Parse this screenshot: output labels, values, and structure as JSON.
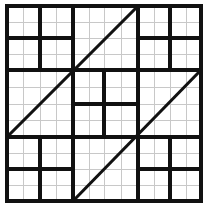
{
  "figure": {
    "type": "geometric-line-figure",
    "canvas": {
      "width": 208,
      "height": 213
    },
    "background_color": "#ffffff",
    "fine_grid_color": "#c8c8c8",
    "thick_line_color": "#111111"
  },
  "chart_data": {
    "type": "diagram",
    "xlabel": "",
    "ylabel": "",
    "xlim": [
      7,
      201
    ],
    "ylim": [
      6,
      201
    ],
    "grid": true,
    "legend": "none",
    "outer_square": {
      "left": 7,
      "top": 6,
      "right": 201,
      "bottom": 201
    },
    "thick_vertical_x": [
      7,
      40,
      73,
      104,
      138,
      170,
      201
    ],
    "thick_horizontal_y": [
      6,
      38,
      70,
      104,
      137,
      169,
      201
    ],
    "fine_grid_step": 16.25,
    "fine_vertical_x": [
      23,
      56,
      89,
      121,
      154,
      186
    ],
    "fine_horizontal_y": [
      22,
      54,
      87,
      120,
      153,
      185
    ],
    "segments": [
      {
        "name": "outer-top",
        "x1": 7,
        "y1": 6,
        "x2": 201,
        "y2": 6
      },
      {
        "name": "outer-bottom",
        "x1": 7,
        "y1": 201,
        "x2": 201,
        "y2": 201
      },
      {
        "name": "outer-left",
        "x1": 7,
        "y1": 6,
        "x2": 7,
        "y2": 201
      },
      {
        "name": "outer-right",
        "x1": 201,
        "y1": 6,
        "x2": 201,
        "y2": 201
      },
      {
        "name": "ring-top",
        "x1": 7,
        "y1": 70,
        "x2": 201,
        "y2": 70
      },
      {
        "name": "ring-bottom",
        "x1": 7,
        "y1": 137,
        "x2": 201,
        "y2": 137
      },
      {
        "name": "ring-left",
        "x1": 73,
        "y1": 6,
        "x2": 73,
        "y2": 201
      },
      {
        "name": "ring-right",
        "x1": 138,
        "y1": 6,
        "x2": 138,
        "y2": 201
      },
      {
        "name": "band-top",
        "x1": 7,
        "y1": 38,
        "x2": 73,
        "y2": 38
      },
      {
        "name": "band-top-right",
        "x1": 138,
        "y1": 38,
        "x2": 201,
        "y2": 38
      },
      {
        "name": "band-bottom",
        "x1": 7,
        "y1": 169,
        "x2": 73,
        "y2": 169
      },
      {
        "name": "band-bottom-right",
        "x1": 138,
        "y1": 169,
        "x2": 201,
        "y2": 169
      },
      {
        "name": "band-left-upper",
        "x1": 40,
        "y1": 6,
        "x2": 40,
        "y2": 70
      },
      {
        "name": "band-left-lower",
        "x1": 40,
        "y1": 137,
        "x2": 40,
        "y2": 201
      },
      {
        "name": "band-right-upper",
        "x1": 170,
        "y1": 6,
        "x2": 170,
        "y2": 70
      },
      {
        "name": "band-right-lower",
        "x1": 170,
        "y1": 137,
        "x2": 170,
        "y2": 201
      },
      {
        "name": "center-vertical",
        "x1": 104,
        "y1": 70,
        "x2": 104,
        "y2": 137
      },
      {
        "name": "center-horizontal",
        "x1": 73,
        "y1": 104,
        "x2": 138,
        "y2": 104
      }
    ],
    "diagonals": [
      {
        "name": "diagonal-upper-left",
        "x1": 7,
        "y1": 137,
        "x2": 138,
        "y2": 6
      },
      {
        "name": "diagonal-lower-right",
        "x1": 73,
        "y1": 201,
        "x2": 201,
        "y2": 70
      }
    ]
  }
}
